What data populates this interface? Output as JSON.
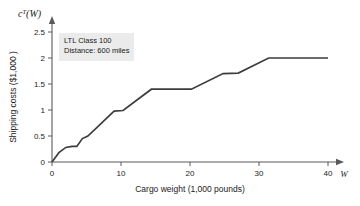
{
  "chart_data": {
    "type": "line",
    "title": "",
    "subtitle": "",
    "xlabel": "Cargo weight (1,000 pounds)",
    "ylabel": "Shipping costs ($1,000 )",
    "y_axis_symbol": "c",
    "y_axis_symbol_sup": "T",
    "y_axis_symbol_arg": "(W)",
    "x_axis_variable": "W",
    "xlim": [
      0,
      42
    ],
    "ylim": [
      0,
      2.72
    ],
    "xticks": [
      0,
      10,
      20,
      30,
      40
    ],
    "xticklabels": [
      "0",
      "10",
      "20",
      "30",
      "40"
    ],
    "yticks": [
      0,
      0.5,
      1,
      1.5,
      2,
      2.5
    ],
    "yticklabels": [
      "0",
      "0.5",
      "1",
      "1.5",
      "2",
      "2.5"
    ],
    "grid": false,
    "legend_position": "none",
    "series": [
      {
        "name": "LTL shipping cost",
        "color": "#3d3d3d",
        "x": [
          0,
          1.0,
          2.0,
          2.9,
          3.6,
          4.4,
          5.2,
          9.0,
          10.3,
          14.4,
          20.2,
          24.8,
          27.0,
          31.4,
          33.2,
          40.0
        ],
        "y": [
          0.0,
          0.18,
          0.28,
          0.3,
          0.3,
          0.45,
          0.5,
          0.98,
          0.99,
          1.4,
          1.4,
          1.7,
          1.71,
          2.0,
          2.0,
          2.0
        ]
      }
    ],
    "annotations": [
      {
        "name": "ltl-class-note",
        "line1": "LTL Class 100",
        "line2": "Distance: 600 miles",
        "background": "#ebebeb"
      }
    ],
    "axis_color": "#5a5a5a",
    "curve_color": "#3d3d3d",
    "background": "#ffffff"
  }
}
